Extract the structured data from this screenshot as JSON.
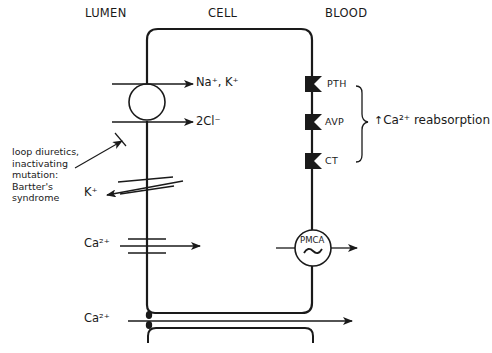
{
  "compartments": {
    "lumen": "LUMEN",
    "cell": "CELL",
    "blood": "BLOOD"
  },
  "transporters": {
    "nkcc2": {
      "ions_in_top": "Na⁺, K⁺",
      "ions_in_bottom": "2Cl⁻"
    },
    "romk": {
      "ion": "K⁺"
    },
    "calcium_channel": {
      "ion": "Ca²⁺"
    },
    "paracellular": {
      "ion": "Ca²⁺"
    },
    "pmca": {
      "label": "PMCA",
      "symbol": "~"
    }
  },
  "receptors": [
    {
      "label": "PTH"
    },
    {
      "label": "AVP"
    },
    {
      "label": "CT"
    }
  ],
  "effect": {
    "arrow": "↑",
    "text": "Ca²⁺ reabsorption"
  },
  "annotation": {
    "text": "loop diuretics,\ninactivating\nmutation:\nBartter's\nsyndrome"
  },
  "colors": {
    "line": "#1a1a1a",
    "background": "#ffffff"
  }
}
